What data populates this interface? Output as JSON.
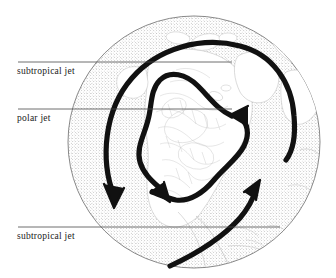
{
  "figure": {
    "name": "jet-stream-globe-diagram",
    "background_color": "#ffffff",
    "ink_color": "#1a1a1a",
    "ocean_stipple_color": "#9a9a9a",
    "land_line_color": "#b4b4b4",
    "arrow_color": "#111111",
    "globe_outline_color": "#6b6b6b"
  },
  "globe": {
    "center_x": 194,
    "center_y": 142,
    "radius": 126,
    "projection_note": "polar view centred on North America"
  },
  "annotations": [
    {
      "id": "subtropical-jet-top",
      "label": "subtropical jet",
      "leader_y": 62,
      "leader_x_start": 18,
      "leader_x_end": 232
    },
    {
      "id": "polar-jet",
      "label": "polar jet",
      "leader_y": 109,
      "leader_x_start": 18,
      "leader_x_end": 232
    },
    {
      "id": "subtropical-jet-bottom",
      "label": "subtropical jet",
      "leader_y": 227,
      "leader_x_start": 18,
      "leader_x_end": 280
    }
  ],
  "flows": [
    {
      "id": "subtropical-jet-arc-upper",
      "label": "subtropical jet",
      "description": "broad arc sweeping from lower-left up over the pole and down the right side",
      "arrowhead_at": [
        113,
        205
      ],
      "direction": "clockwise-to-southwest"
    },
    {
      "id": "polar-jet-meander",
      "label": "polar jet",
      "description": "meandering wavy ridge-and-trough path across North America",
      "arrowhead_at": [
        166,
        197
      ],
      "direction": "southeastward"
    },
    {
      "id": "polar-jet-return",
      "label": "polar jet",
      "description": "short eastward segment with arrowhead pointing right-to-left near the Atlantic",
      "arrowhead_at": [
        238,
        113
      ],
      "direction": "eastward"
    },
    {
      "id": "subtropical-jet-arc-lower",
      "label": "subtropical jet",
      "description": "arc sweeping from lower-left up toward the northeast",
      "arrowhead_at": [
        256,
        184
      ],
      "direction": "northeastward"
    }
  ]
}
